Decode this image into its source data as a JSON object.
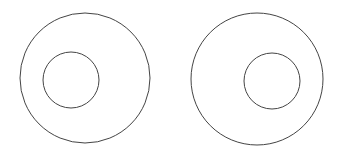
{
  "diagram": {
    "stroke_color": "#444444",
    "background": "#ffffff",
    "figures": [
      {
        "name": "left",
        "outer": {
          "cx": 85,
          "cy": 78,
          "r": 65
        },
        "inner": {
          "cx": 71,
          "cy": 80,
          "r": 28
        }
      },
      {
        "name": "right",
        "outer": {
          "cx": 257,
          "cy": 79,
          "r": 66
        },
        "inner": {
          "cx": 272,
          "cy": 81,
          "r": 28
        }
      }
    ]
  }
}
